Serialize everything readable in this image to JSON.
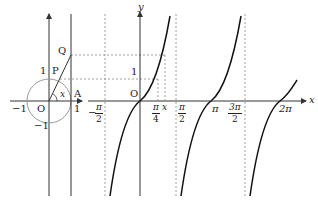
{
  "unit_circle": {
    "labels": {
      "Q": "Q",
      "P": "P",
      "A": "A",
      "O": "O",
      "one_top": "1",
      "one_right": "1",
      "minus_one_left": "−1",
      "minus_one_bottom": "−1",
      "angle": "x"
    }
  },
  "tan_graph": {
    "axis_x": "x",
    "axis_y": "y",
    "origin": "O",
    "y_one": "1",
    "x_point": "x",
    "ticks": {
      "neg_pi_2": {
        "sign": "−",
        "num": "π",
        "den": "2"
      },
      "pi_4": {
        "num": "π",
        "den": "4"
      },
      "pi_2": {
        "num": "π",
        "den": "2"
      },
      "pi": "π",
      "three_pi_2": {
        "num": "3π",
        "den": "2"
      },
      "two_pi": "2π"
    }
  },
  "colors": {
    "axis": "#333333",
    "curve": "#111111",
    "circle": "#999999",
    "dashed": "#888888"
  }
}
